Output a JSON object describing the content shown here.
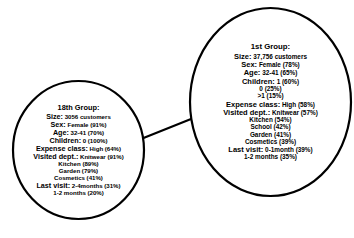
{
  "diagram": {
    "type": "node-link-diagram",
    "background_color": "#ffffff",
    "stroke_color": "#000000",
    "nodes": [
      {
        "id": "group-18",
        "shape": "ellipse",
        "title": "18th Group:",
        "rows": [
          {
            "key": "Size:",
            "value": "3056 customers"
          },
          {
            "key": "Sex:",
            "value": "Female (91%)"
          },
          {
            "key": "Age:",
            "value": "32-41 (70%)"
          },
          {
            "key": "Children:",
            "value": "0 (100%)"
          },
          {
            "key": "Expense class:",
            "value": "High (64%)"
          },
          {
            "key": "Visited dept.:",
            "value": "Knitwear (91%)"
          }
        ],
        "dept_extra": [
          "Kitchen (89%)",
          "Garden (79%)",
          "Cosmetics (41%)"
        ],
        "last_visit": {
          "key": "Last visit:",
          "value": "2-4months (31%)"
        },
        "last_visit_extra": [
          "1-2 months (20%)"
        ]
      },
      {
        "id": "group-1",
        "shape": "ellipse",
        "title": "1st Group:",
        "rows": [
          {
            "key": "Size:",
            "value": "37,756 customers"
          },
          {
            "key": "Sex:",
            "value": "Female (78%)"
          },
          {
            "key": "Age:",
            "value": "32-41 (65%)"
          },
          {
            "key": "Children:",
            "value": "1 (60%)"
          }
        ],
        "children_extra": [
          "0 (25%)",
          ">1 (15%)"
        ],
        "rows2": [
          {
            "key": "Expense class:",
            "value": "High (58%)"
          },
          {
            "key": "Visited dept.:",
            "value": "Knitwear (57%)"
          }
        ],
        "dept_extra": [
          "Kitchen (54%)",
          "School (42%)",
          "Garden (41%)",
          "Cosmetics (39%)"
        ],
        "last_visit": {
          "key": "Last visit:",
          "value": "0-1month (39%)"
        },
        "last_visit_extra": [
          "1-2 months (35%)"
        ]
      }
    ],
    "edges": [
      {
        "from": "group-18",
        "to": "group-1"
      }
    ]
  }
}
